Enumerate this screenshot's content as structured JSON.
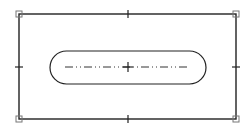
{
  "diagram": {
    "type": "cad-sketch",
    "colors": {
      "background": "#ffffff",
      "stroke": "#222222",
      "handle": "#777777"
    },
    "outer_rectangle": {
      "x1": 19,
      "y1": 14,
      "x2": 236,
      "y2": 119
    },
    "corner_handles": [
      {
        "id": "top-left",
        "x": 19,
        "y": 14
      },
      {
        "id": "top-right",
        "x": 236,
        "y": 14
      },
      {
        "id": "bottom-left",
        "x": 19,
        "y": 119
      },
      {
        "id": "bottom-right",
        "x": 236,
        "y": 119
      }
    ],
    "midpoint_ticks": [
      {
        "id": "top",
        "x": 128,
        "y": 14,
        "orientation": "vertical"
      },
      {
        "id": "bottom",
        "x": 128,
        "y": 119,
        "orientation": "vertical"
      },
      {
        "id": "left",
        "x": 19,
        "y": 67,
        "orientation": "horizontal"
      },
      {
        "id": "right",
        "x": 236,
        "y": 67,
        "orientation": "horizontal"
      }
    ],
    "slot": {
      "x1": 50,
      "y1": 51,
      "x2": 206,
      "y2": 84,
      "radius": 16.5
    },
    "center_line": {
      "x1": 65,
      "x2": 189,
      "y": 67,
      "style": "dash-dot-dot"
    },
    "center_mark": {
      "x": 128,
      "y": 67,
      "size": 5
    }
  }
}
